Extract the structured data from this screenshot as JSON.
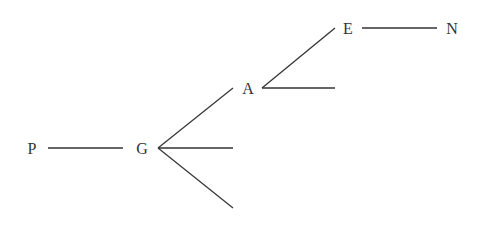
{
  "diagram": {
    "type": "tree",
    "nodes": [
      {
        "id": "P",
        "label": "P",
        "x": 32,
        "y": 148
      },
      {
        "id": "G",
        "label": "G",
        "x": 142,
        "y": 148
      },
      {
        "id": "A",
        "label": "A",
        "x": 248,
        "y": 88
      },
      {
        "id": "E",
        "label": "E",
        "x": 348,
        "y": 28
      },
      {
        "id": "N",
        "label": "N",
        "x": 452,
        "y": 28
      }
    ],
    "edges": [
      {
        "from": "P",
        "to": "G"
      },
      {
        "from": "G",
        "to": "A"
      },
      {
        "from": "G",
        "to": "empty-1"
      },
      {
        "from": "G",
        "to": "empty-2"
      },
      {
        "from": "A",
        "to": "E"
      },
      {
        "from": "A",
        "to": "empty-3"
      },
      {
        "from": "E",
        "to": "N"
      }
    ],
    "colors": {
      "line": "#333333",
      "text": "#333333",
      "background": "#ffffff"
    }
  }
}
